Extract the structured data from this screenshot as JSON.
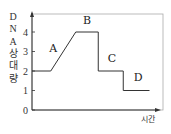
{
  "chart_data": {
    "type": "line",
    "title": "",
    "xlabel": "시간",
    "ylabel_chars": [
      "D",
      "N",
      "A",
      "상",
      "대",
      "량"
    ],
    "ylabel": "DNA 상대량",
    "yticks": [
      "0",
      "1",
      "2",
      "3",
      "4"
    ],
    "ylim": [
      0,
      4.5
    ],
    "xlim": [
      0,
      10
    ],
    "grid": false,
    "series": [
      {
        "name": "DNA 상대량",
        "points": [
          [
            0,
            2
          ],
          [
            1.5,
            2
          ],
          [
            3.5,
            4
          ],
          [
            5.3,
            4
          ],
          [
            5.3,
            2
          ],
          [
            7.3,
            2
          ],
          [
            7.3,
            1
          ],
          [
            9.4,
            1
          ]
        ]
      }
    ],
    "annotations": [
      {
        "text": "A",
        "x": 1.7,
        "y": 3.0
      },
      {
        "text": "B",
        "x": 4.4,
        "y": 4.4
      },
      {
        "text": "C",
        "x": 6.4,
        "y": 2.45
      },
      {
        "text": "D",
        "x": 8.5,
        "y": 1.5
      }
    ],
    "line_color": "#333333"
  }
}
